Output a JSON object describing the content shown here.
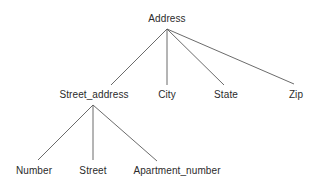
{
  "diagram": {
    "type": "tree",
    "background_color": "#ffffff",
    "text_color": "#2b2b2b",
    "edge_color": "#5a5a5a",
    "nodes": [
      {
        "id": "address",
        "label": "Address",
        "level": 0,
        "x": 167,
        "y": 13
      },
      {
        "id": "street_address",
        "label": "Street_address",
        "level": 1,
        "x": 94,
        "y": 89
      },
      {
        "id": "city",
        "label": "City",
        "level": 1,
        "x": 167,
        "y": 89
      },
      {
        "id": "state",
        "label": "State",
        "level": 1,
        "x": 226,
        "y": 89
      },
      {
        "id": "zip",
        "label": "Zip",
        "level": 1,
        "x": 296,
        "y": 89
      },
      {
        "id": "number",
        "label": "Number",
        "level": 2,
        "x": 34,
        "y": 165
      },
      {
        "id": "street",
        "label": "Street",
        "level": 2,
        "x": 93,
        "y": 165
      },
      {
        "id": "apartment_number",
        "label": "Apartment_number",
        "level": 2,
        "x": 177,
        "y": 165
      }
    ],
    "edges": [
      {
        "from": "address",
        "to": "street_address",
        "x1": 167,
        "y1": 29,
        "x2": 111,
        "y2": 85
      },
      {
        "from": "address",
        "to": "city",
        "x1": 167,
        "y1": 29,
        "x2": 167,
        "y2": 85
      },
      {
        "from": "address",
        "to": "state",
        "x1": 167,
        "y1": 29,
        "x2": 224,
        "y2": 85
      },
      {
        "from": "address",
        "to": "zip",
        "x1": 167,
        "y1": 29,
        "x2": 294,
        "y2": 84
      },
      {
        "from": "street_address",
        "to": "number",
        "x1": 93,
        "y1": 105,
        "x2": 38,
        "y2": 160
      },
      {
        "from": "street_address",
        "to": "street",
        "x1": 93,
        "y1": 105,
        "x2": 93,
        "y2": 160
      },
      {
        "from": "street_address",
        "to": "apartment_number",
        "x1": 93,
        "y1": 105,
        "x2": 157,
        "y2": 161
      }
    ]
  }
}
